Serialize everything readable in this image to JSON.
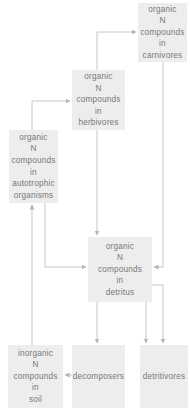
{
  "diagram": {
    "type": "flow-diagram",
    "nodes": {
      "carnivores": {
        "label": "organic\nN\ncompounds\nin\ncarnivores"
      },
      "herbivores": {
        "label": "organic\nN\ncompounds\nin\nherbivores"
      },
      "autotrophic": {
        "label": "organic\nN\ncompounds\nin\nautotrophic\norganisms"
      },
      "detritus": {
        "label": "organic\nN\ncompounds\nin\ndetritus"
      },
      "soil": {
        "label": "inorganic\nN\ncompounds\nin\nsoil"
      },
      "decomposers": {
        "label": "decomposers"
      },
      "detritivores": {
        "label": "detritivores"
      }
    },
    "edges": [
      {
        "from": "soil",
        "to": "autotrophic"
      },
      {
        "from": "autotrophic",
        "to": "herbivores"
      },
      {
        "from": "herbivores",
        "to": "carnivores"
      },
      {
        "from": "autotrophic",
        "to": "detritus"
      },
      {
        "from": "herbivores",
        "to": "detritus"
      },
      {
        "from": "carnivores",
        "to": "detritus"
      },
      {
        "from": "detritus",
        "to": "decomposers"
      },
      {
        "from": "detritus",
        "to": "detritivores"
      },
      {
        "from": "detritus",
        "to": "detritivores",
        "note": "second arrow via right side of detritus box"
      },
      {
        "from": "decomposers",
        "to": "soil"
      }
    ]
  },
  "colors": {
    "background": "#ffffff",
    "box-fill": "#ededed",
    "box-text": "#777777",
    "connector": "#c6c6c6",
    "connector-head": "#b5b5b5"
  }
}
